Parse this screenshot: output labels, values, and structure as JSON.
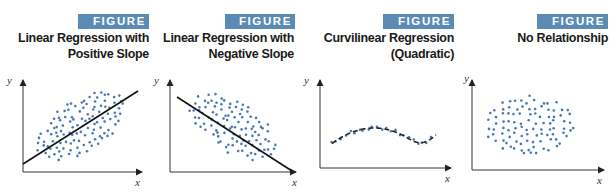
{
  "figures": [
    {
      "badge": "FIGURE 3.15",
      "title_line1": "Linear Regression with",
      "title_line2": "Positive Slope",
      "xlabel": "x",
      "ylabel": "y"
    },
    {
      "badge": "FIGURE 3.16",
      "title_line1": "Linear Regression with",
      "title_line2": "Negative Slope",
      "xlabel": "x",
      "ylabel": "y"
    },
    {
      "badge": "FIGURE 3.17",
      "title_line1": "Curvilinear Regression",
      "title_line2": "(Quadratic)",
      "xlabel": "x",
      "ylabel": "y"
    },
    {
      "badge": "FIGURE 3.18",
      "title_line1": "No Relationship",
      "title_line2": "",
      "xlabel": "x",
      "ylabel": "y"
    }
  ],
  "colors": {
    "badge_bg": "#5b8bb5",
    "badge_text": "#ffffff",
    "point": "#4a78b0",
    "line": "#111111",
    "axis": "#333333"
  },
  "chart_data": [
    {
      "type": "scatter",
      "title": "Linear Regression with Positive Slope",
      "xlabel": "x",
      "ylabel": "y",
      "grid": false,
      "annotation": "Elliptical point cloud tilted upward with a solid fitted regression line of positive slope",
      "regression_line": {
        "style": "solid",
        "slope_sign": "positive"
      }
    },
    {
      "type": "scatter",
      "title": "Linear Regression with Negative Slope",
      "xlabel": "x",
      "ylabel": "y",
      "grid": false,
      "annotation": "Elliptical point cloud tilted downward with a solid fitted regression line of negative slope",
      "regression_line": {
        "style": "solid",
        "slope_sign": "negative"
      }
    },
    {
      "type": "scatter",
      "title": "Curvilinear Regression (Quadratic)",
      "xlabel": "x",
      "ylabel": "y",
      "grid": false,
      "annotation": "Points follow a U-shaped (quadratic) curve; dashed fitted curve with minimum left of center",
      "regression_line": {
        "style": "dashed",
        "shape": "quadratic"
      }
    },
    {
      "type": "scatter",
      "title": "No Relationship",
      "xlabel": "x",
      "ylabel": "y",
      "grid": false,
      "annotation": "Roughly circular cloud of points with no trend; no fitted line"
    }
  ]
}
